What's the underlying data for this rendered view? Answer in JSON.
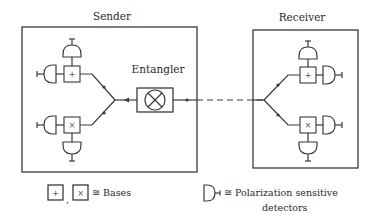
{
  "diagram": {
    "sender": {
      "label": "Sender"
    },
    "receiver": {
      "label": "Receiver"
    },
    "entangler": {
      "label": "Entangler",
      "symbol": "circled-cross"
    },
    "channel": {
      "style": "dashed"
    },
    "bases": {
      "plus": "+",
      "cross": "×"
    }
  },
  "legend": {
    "bases": {
      "comma": ",",
      "text": "≅ Bases"
    },
    "detectors": {
      "line1": "≅ Polarization sensitive",
      "line2": "detectors"
    }
  },
  "colors": {
    "stroke": "#3a3a3a",
    "text": "#2a2a2a",
    "background": "#ffffff"
  }
}
